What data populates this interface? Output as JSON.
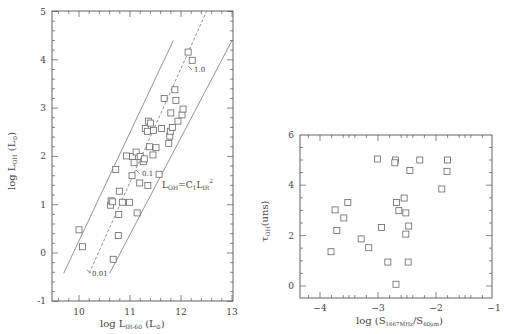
{
  "chart_data": [
    {
      "type": "scatter",
      "panel": "left",
      "title": "",
      "xlabel": "log L_{IR-60} (L_⊙)",
      "ylabel": "log L_{OH} (L_⊙)",
      "xlim": [
        9.5,
        13
      ],
      "ylim": [
        -1,
        5
      ],
      "xticks": [
        10,
        11,
        12,
        13
      ],
      "yticks": [
        -1,
        0,
        1,
        2,
        3,
        4,
        5
      ],
      "grid": false,
      "legend": null,
      "series": [
        {
          "name": "galaxies",
          "marker": "open-square",
          "points": [
            [
              10.0,
              0.48
            ],
            [
              10.07,
              0.13
            ],
            [
              10.62,
              0.99
            ],
            [
              10.63,
              1.08
            ],
            [
              10.66,
              1.06
            ],
            [
              10.67,
              -0.13
            ],
            [
              10.72,
              1.73
            ],
            [
              10.77,
              0.36
            ],
            [
              10.78,
              0.8
            ],
            [
              10.79,
              1.28
            ],
            [
              10.85,
              1.05
            ],
            [
              10.93,
              2.01
            ],
            [
              10.99,
              1.05
            ],
            [
              11.04,
              1.6
            ],
            [
              11.05,
              2.0
            ],
            [
              11.08,
              1.87
            ],
            [
              11.12,
              2.09
            ],
            [
              11.14,
              0.83
            ],
            [
              11.19,
              1.45
            ],
            [
              11.2,
              2.0
            ],
            [
              11.26,
              1.89
            ],
            [
              11.28,
              1.95
            ],
            [
              11.3,
              2.58
            ],
            [
              11.34,
              2.52
            ],
            [
              11.35,
              1.4
            ],
            [
              11.36,
              2.73
            ],
            [
              11.38,
              2.2
            ],
            [
              11.4,
              2.69
            ],
            [
              11.45,
              2.03
            ],
            [
              11.46,
              2.54
            ],
            [
              11.51,
              2.18
            ],
            [
              11.57,
              1.63
            ],
            [
              11.62,
              2.58
            ],
            [
              11.67,
              3.2
            ],
            [
              11.76,
              2.27
            ],
            [
              11.78,
              2.42
            ],
            [
              11.79,
              2.52
            ],
            [
              11.8,
              2.9
            ],
            [
              11.83,
              2.6
            ],
            [
              11.88,
              3.38
            ],
            [
              11.9,
              3.16
            ],
            [
              11.94,
              2.73
            ],
            [
              12.02,
              2.86
            ],
            [
              12.04,
              2.98
            ],
            [
              12.14,
              4.16
            ],
            [
              12.22,
              3.99
            ]
          ]
        }
      ],
      "lines": [
        {
          "name": "upper-bound",
          "style": "solid",
          "from": [
            9.7,
            -0.42
          ],
          "to": [
            11.85,
            4.4
          ]
        },
        {
          "name": "model-LOH-C1-LIR2",
          "style": "dashed",
          "from": [
            10.2,
            -0.42
          ],
          "to": [
            12.5,
            5.0
          ]
        },
        {
          "name": "lower-bound",
          "style": "solid",
          "from": [
            10.6,
            -0.42
          ],
          "to": [
            13.0,
            4.4
          ]
        }
      ],
      "annotations": [
        {
          "text": "1.0",
          "at": [
            12.25,
            3.7
          ]
        },
        {
          "text": "0.1",
          "at": [
            11.25,
            1.62
          ]
        },
        {
          "text": "0.01",
          "at": [
            10.25,
            -0.42
          ]
        },
        {
          "text": "L_{OH}=C_1 L_{IR}^2",
          "at": [
            11.6,
            1.4
          ]
        }
      ]
    },
    {
      "type": "scatter",
      "panel": "right",
      "title": "",
      "xlabel": "log (S_{1667MHz}/S_{60μm})",
      "ylabel": "τ_{OH}(uns)",
      "xlim": [
        -4.35,
        -1
      ],
      "ylim": [
        -0.5,
        6
      ],
      "xticks": [
        -4,
        -3,
        -2,
        -1
      ],
      "yticks": [
        0,
        2,
        4,
        6
      ],
      "grid": false,
      "legend": null,
      "series": [
        {
          "name": "galaxies",
          "marker": "open-square",
          "points": [
            [
              -3.01,
              5.04
            ],
            [
              -2.7,
              5.0
            ],
            [
              -2.71,
              4.89
            ],
            [
              -2.28,
              5.0
            ],
            [
              -1.8,
              5.0
            ],
            [
              -2.45,
              4.58
            ],
            [
              -1.81,
              4.55
            ],
            [
              -1.9,
              3.85
            ],
            [
              -3.52,
              3.31
            ],
            [
              -3.74,
              3.02
            ],
            [
              -3.59,
              2.7
            ],
            [
              -3.71,
              2.2
            ],
            [
              -3.81,
              1.36
            ],
            [
              -3.29,
              1.87
            ],
            [
              -3.16,
              1.52
            ],
            [
              -2.94,
              2.32
            ],
            [
              -2.68,
              3.31
            ],
            [
              -2.55,
              3.49
            ],
            [
              -2.64,
              2.99
            ],
            [
              -2.52,
              2.9
            ],
            [
              -2.47,
              2.38
            ],
            [
              -2.52,
              2.06
            ],
            [
              -2.83,
              0.95
            ],
            [
              -2.48,
              0.95
            ],
            [
              -2.69,
              0.07
            ]
          ]
        }
      ]
    }
  ],
  "left_panel": {
    "x_tick_labels": [
      "10",
      "11",
      "12",
      "13"
    ],
    "y_tick_labels": [
      "-1",
      "0",
      "1",
      "2",
      "3",
      "4",
      "5"
    ],
    "xlabel_main": "log L",
    "xlabel_sub": "IR-60",
    "xlabel_unit": "(L",
    "ylabel_main": "log L",
    "ylabel_sub": "OH",
    "ylabel_unit": "(L",
    "relation_label": "L",
    "relation_sub1": "OH",
    "relation_eq": "=C",
    "relation_sub2": "1",
    "relation_L": "L",
    "relation_sub3": "IR",
    "relation_sup": "2",
    "line_labels": [
      "1.0",
      "0.1",
      "0.01"
    ]
  },
  "right_panel": {
    "x_tick_labels": [
      "−4",
      "−3",
      "−2",
      "−1"
    ],
    "y_tick_labels": [
      "0",
      "2",
      "4",
      "6"
    ],
    "xlabel_main": "log (S",
    "xlabel_sub1": "1667MHz",
    "xlabel_mid": "/S",
    "xlabel_sub2": "60μm",
    "xlabel_end": ")",
    "ylabel_main": "τ",
    "ylabel_sub": "OH",
    "ylabel_unit": "(uns)"
  },
  "colors": {
    "axis": "#555555",
    "marker": "#666666",
    "line": "#777777",
    "text": "#444444"
  }
}
